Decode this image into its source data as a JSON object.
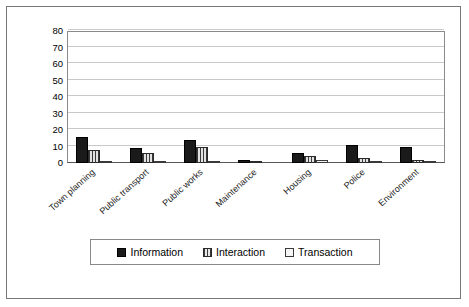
{
  "chart_data": {
    "type": "bar",
    "title": "",
    "subtitle": "",
    "xlabel": "",
    "ylabel": "",
    "ylim": [
      0,
      80
    ],
    "ytick_step": 10,
    "ytick_labels": [
      "80",
      "70",
      "60",
      "50",
      "40",
      "30",
      "20",
      "10",
      "0"
    ],
    "grid": true,
    "grid_axis": "y",
    "legend_position": "bottom-center",
    "categories": [
      "Town planning",
      "Public transport",
      "Public works",
      "Maintenance",
      "Housing",
      "Police",
      "Environment"
    ],
    "series": [
      {
        "name": "Information",
        "color": "#1a1a1a",
        "pattern": "solid",
        "values": [
          16,
          9,
          14,
          2,
          6,
          11,
          10
        ]
      },
      {
        "name": "Interaction",
        "color": "#d4d4d4",
        "pattern": "vertical-stripes",
        "values": [
          8,
          6,
          10,
          1,
          4,
          3,
          2
        ]
      },
      {
        "name": "Transaction",
        "color": "#f2f2f2",
        "pattern": "empty",
        "values": [
          0.5,
          0.5,
          0.5,
          0,
          2,
          0.5,
          0.5
        ]
      }
    ]
  }
}
